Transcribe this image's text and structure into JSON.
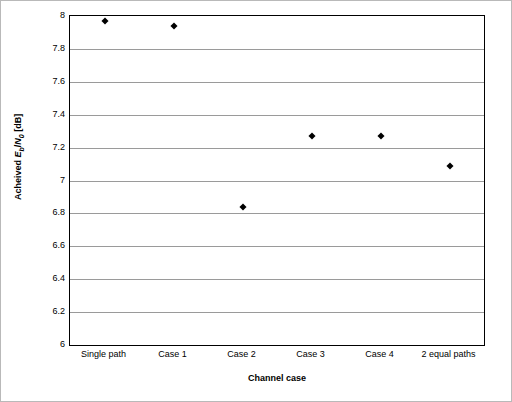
{
  "chart_data": {
    "type": "scatter",
    "title": "",
    "xlabel": "Channel case",
    "ylabel": "Acheived Eb/N0 [dB]",
    "categories": [
      "Single path",
      "Case 1",
      "Case 2",
      "Case 3",
      "Case 4",
      "2 equal paths"
    ],
    "values": [
      7.97,
      7.94,
      6.84,
      7.27,
      7.27,
      7.09
    ],
    "ylim": [
      6,
      8
    ],
    "ytick_labels": [
      "6",
      "6.2",
      "6.4",
      "6.6",
      "6.8",
      "7",
      "7.2",
      "7.4",
      "7.6",
      "7.8",
      "8"
    ],
    "ytick_values": [
      6,
      6.2,
      6.4,
      6.6,
      6.8,
      7,
      7.2,
      7.4,
      7.6,
      7.8,
      8
    ],
    "grid": "horizontal",
    "legend": "none",
    "marker": "diamond",
    "marker_color": "#000000"
  },
  "axis_titles": {
    "y_prefix": "Acheived ",
    "y_e": "E",
    "y_b": "b",
    "y_slash": "/",
    "y_n": "N",
    "y_0": "0",
    "y_suffix": " [dB]",
    "x": "Channel case"
  }
}
